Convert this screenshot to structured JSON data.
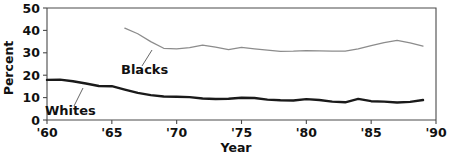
{
  "chart_data": {
    "type": "line",
    "title": "",
    "xlabel": "Year",
    "ylabel": "Percent",
    "xlim": [
      1960,
      1990
    ],
    "ylim": [
      0,
      50
    ],
    "grid": false,
    "legend_position": "inline-annotations",
    "x_tick_labels": [
      "'60",
      "'65",
      "'70",
      "'75",
      "'80",
      "'85",
      "'90"
    ],
    "x_tick_values": [
      1960,
      1965,
      1970,
      1975,
      1980,
      1985,
      1990
    ],
    "y_tick_labels": [
      "0",
      "10",
      "20",
      "30",
      "40",
      "50"
    ],
    "y_tick_values": [
      0,
      10,
      20,
      30,
      40,
      50
    ],
    "series": [
      {
        "name": "Whites",
        "color": "#1a1a1a",
        "x": [
          1960,
          1961,
          1962,
          1963,
          1964,
          1965,
          1966,
          1967,
          1968,
          1969,
          1970,
          1971,
          1972,
          1973,
          1974,
          1975,
          1976,
          1977,
          1978,
          1979,
          1980,
          1981,
          1982,
          1983,
          1984,
          1985,
          1986,
          1987,
          1988,
          1989
        ],
        "values": [
          17.9,
          18.0,
          17.3,
          16.3,
          15.2,
          15.1,
          13.6,
          12.1,
          11.1,
          10.5,
          10.4,
          10.2,
          9.6,
          9.4,
          9.5,
          9.9,
          9.8,
          9.1,
          8.8,
          8.7,
          9.3,
          8.9,
          8.2,
          7.9,
          9.4,
          8.4,
          8.2,
          7.8,
          8.1,
          8.9
        ],
        "linewidth": 2.4
      },
      {
        "name": "Blacks",
        "color": "#8c8c8c",
        "x": [
          1966,
          1967,
          1968,
          1969,
          1970,
          1971,
          1972,
          1973,
          1974,
          1975,
          1976,
          1977,
          1978,
          1979,
          1980,
          1981,
          1982,
          1983,
          1984,
          1985,
          1986,
          1987,
          1988,
          1989
        ],
        "values": [
          41.0,
          38.5,
          35.0,
          32.0,
          31.7,
          32.3,
          33.4,
          32.5,
          31.4,
          32.4,
          31.8,
          31.2,
          30.6,
          30.7,
          31.0,
          30.9,
          30.7,
          30.8,
          31.8,
          33.2,
          34.5,
          35.5,
          34.4,
          33.0
        ],
        "linewidth": 1.25
      }
    ],
    "annotations": [
      {
        "name": "whites-label",
        "text": "Whites",
        "text_x": 45,
        "text_y": 115,
        "leader_from_x": 74,
        "leader_from_y": 106,
        "leader_to_x": 83,
        "leader_to_y": 88
      },
      {
        "name": "blacks-label",
        "text": "Blacks",
        "text_x": 121,
        "text_y": 74,
        "leader_from_x": 142,
        "leader_from_y": 66,
        "leader_to_x": 152,
        "leader_to_y": 50
      }
    ]
  },
  "axes": {
    "x_title": "Year",
    "y_title": "Percent"
  },
  "colors": {
    "whites_line": "#1a1a1a",
    "blacks_line": "#8c8c8c",
    "axis": "#4a4a4a",
    "text": "#111111",
    "background": "#ffffff"
  }
}
